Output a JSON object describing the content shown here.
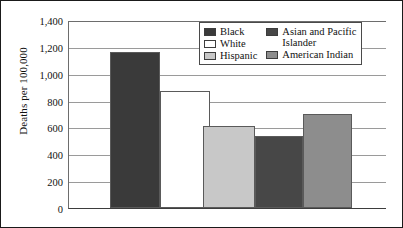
{
  "chart_data": {
    "type": "bar",
    "title": "",
    "xlabel": "",
    "ylabel": "Deaths per 100,000",
    "ylim": [
      0,
      1400
    ],
    "ytick_step": 200,
    "grid": true,
    "legend_position": "top-right-inside",
    "categories": [
      "Black",
      "White",
      "Hispanic",
      "Asian and Pacific Islander",
      "American Indian"
    ],
    "values": [
      1160,
      870,
      612,
      540,
      703
    ],
    "ytick_labels": [
      "1,400",
      "1,200",
      "1,000",
      "800",
      "600",
      "400",
      "200",
      "0"
    ],
    "ytick_values": [
      1400,
      1200,
      1000,
      800,
      600,
      400,
      200,
      0
    ],
    "series": [
      {
        "name": "Deaths per 100,000",
        "points": [
          {
            "label": "Black",
            "value": 1160,
            "color": "#3a3a3a"
          },
          {
            "label": "White",
            "value": 870,
            "color": "#ffffff"
          },
          {
            "label": "Hispanic",
            "value": 612,
            "color": "#c8c8c8"
          },
          {
            "label": "Asian and Pacific Islander",
            "value": 540,
            "color": "#474747"
          },
          {
            "label": "American Indian",
            "value": 703,
            "color": "#8d8d8d"
          }
        ]
      }
    ]
  },
  "axis": {
    "y_title": "Deaths per 100,000"
  },
  "legend": {
    "columns": [
      {
        "items": [
          {
            "label": "Black",
            "color": "#3a3a3a"
          },
          {
            "label": "White",
            "color": "#ffffff"
          },
          {
            "label": "Hispanic",
            "color": "#c8c8c8"
          }
        ]
      },
      {
        "items": [
          {
            "label": "Asian and Pacific\nIslander",
            "color": "#474747"
          },
          {
            "label": "American Indian",
            "color": "#8d8d8d"
          }
        ]
      }
    ]
  }
}
